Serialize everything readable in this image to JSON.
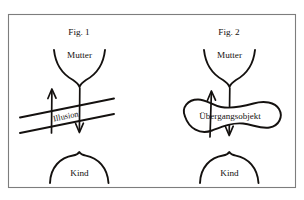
{
  "figure": {
    "background_color": "#ffffff",
    "ink_color": "#14110f",
    "frame_color": "#7d7d7d",
    "panels": [
      {
        "id": "fig-1",
        "caption": "Fig. 1",
        "nodes": {
          "top_label": "Mutter",
          "bottom_label": "Kind"
        },
        "middle_label": "Illusion",
        "middle_kind": "barrier-lines",
        "arrows": [
          {
            "name": "upward-arrow",
            "direction": "up",
            "from": "Kind",
            "to": "Mutter"
          },
          {
            "name": "downward-arrow",
            "direction": "down",
            "from": "Mutter",
            "to": "Kind"
          }
        ]
      },
      {
        "id": "fig-2",
        "caption": "Fig. 2",
        "nodes": {
          "top_label": "Mutter",
          "bottom_label": "Kind"
        },
        "middle_label": "Übergangsobjekt",
        "middle_kind": "blob-shape",
        "arrows": [
          {
            "name": "upward-arrow",
            "direction": "up",
            "from": "Kind",
            "to": "Mutter"
          },
          {
            "name": "downward-arrow",
            "direction": "down",
            "from": "Mutter",
            "to": "Kind"
          }
        ]
      }
    ]
  }
}
